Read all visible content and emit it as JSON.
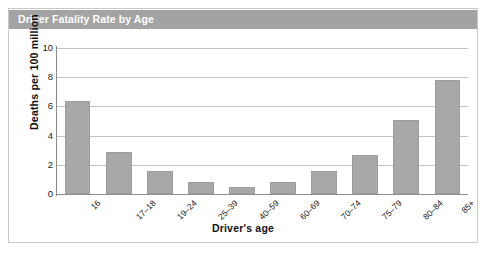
{
  "chart_data": {
    "type": "bar",
    "title": "Driver Fatality Rate by Age",
    "xlabel": "Driver's age",
    "ylabel": "Deaths per 100 million",
    "categories": [
      "16",
      "17–18",
      "19–24",
      "25–39",
      "40–59",
      "60–69",
      "70–74",
      "75–79",
      "80–84",
      "85+"
    ],
    "values": [
      6.35,
      2.85,
      1.6,
      0.85,
      0.5,
      0.85,
      1.6,
      2.7,
      5.1,
      7.8
    ],
    "ylim": [
      0,
      10
    ],
    "yticks": [
      "0",
      "2",
      "4",
      "6",
      "8",
      "10"
    ],
    "ytick_values": [
      0,
      2,
      4,
      6,
      8,
      10
    ],
    "grid": true,
    "legend": "none",
    "bar_color": "#a8a8a8",
    "title_bar_color": "#a3a3a3",
    "gridline_color": "#c3c3c3"
  }
}
